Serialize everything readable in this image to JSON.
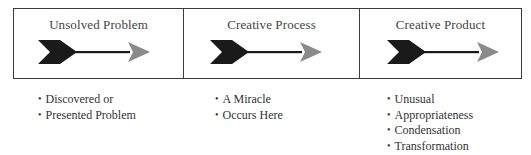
{
  "diagram": {
    "type": "process-flow",
    "colors": {
      "border": "#3a3a3a",
      "arrow_tail": "#1a1a1a",
      "arrow_shaft": "#1a1a1a",
      "arrow_head": "#8a8a8a",
      "text": "#444444"
    },
    "stages": [
      {
        "title": "Unsolved Problem",
        "icon": "arrow-right-icon",
        "bullets": [
          "Discovered or",
          "Presented Problem"
        ]
      },
      {
        "title": "Creative Process",
        "icon": "arrow-right-icon",
        "bullets": [
          "A Miracle",
          "Occurs Here"
        ]
      },
      {
        "title": "Creative Product",
        "icon": "arrow-right-icon",
        "bullets": [
          "Unusual",
          "Appropriateness",
          "Condensation",
          "Transformation"
        ]
      }
    ]
  }
}
